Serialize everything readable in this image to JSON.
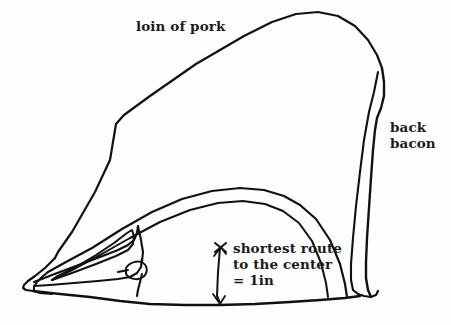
{
  "figure": {
    "background_color": "#fefefe",
    "ink_color": "#111111",
    "style": "hand-drawn ink line drawing"
  },
  "labels": {
    "loin": "loin of pork",
    "bacon_line1": "back",
    "bacon_line2": "bacon",
    "measure_line1": "shortest route",
    "measure_line2": "to the center",
    "measure_line3": "= 1in"
  },
  "annotation": {
    "measurement_value": "1in",
    "marker": "x-mark",
    "arrow": "double-ended-vertical-arrow"
  },
  "regions": [
    {
      "name": "loin-of-pork",
      "label": "loin of pork"
    },
    {
      "name": "back-bacon",
      "label": "back bacon"
    },
    {
      "name": "eye-of-loin",
      "label": ""
    },
    {
      "name": "vertebra-bone",
      "label": ""
    }
  ]
}
